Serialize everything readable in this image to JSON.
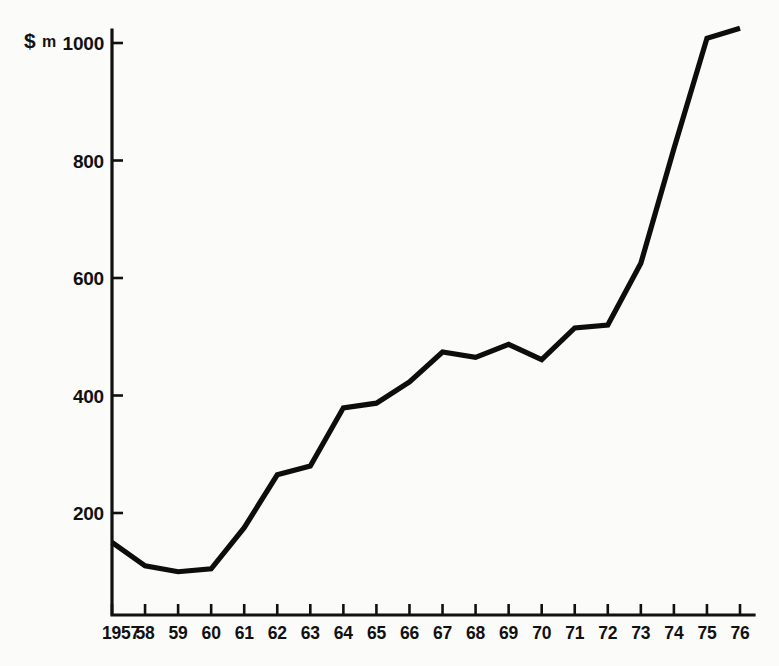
{
  "chart_data": {
    "type": "line",
    "title": "",
    "subtitle": "",
    "xlabel": "",
    "ylabel": "$ m",
    "unit_currency_symbol": "$",
    "unit_suffix": "m",
    "x": [
      1957,
      1958,
      1959,
      1960,
      1961,
      1962,
      1963,
      1964,
      1965,
      1966,
      1967,
      1968,
      1969,
      1970,
      1971,
      1972,
      1973,
      1974,
      1975,
      1976
    ],
    "xtick_labels": [
      "1957",
      "58",
      "59",
      "60",
      "61",
      "62",
      "63",
      "64",
      "65",
      "66",
      "67",
      "68",
      "69",
      "70",
      "71",
      "72",
      "73",
      "74",
      "75",
      "76"
    ],
    "values": [
      150,
      110,
      100,
      105,
      175,
      265,
      280,
      379,
      387,
      423,
      474,
      465,
      487,
      461,
      515,
      520,
      625,
      820,
      1008,
      1025
    ],
    "ytick_values": [
      200,
      400,
      600,
      800,
      1000
    ],
    "ytick_labels": [
      "200",
      "400",
      "600",
      "800",
      "1000"
    ],
    "ylim": [
      0,
      1070
    ],
    "xlim": [
      1957,
      1976
    ],
    "grid": false,
    "legend": false,
    "legend_position": "none",
    "series": [
      {
        "name": "",
        "values": [
          150,
          110,
          100,
          105,
          175,
          265,
          280,
          379,
          387,
          423,
          474,
          465,
          487,
          461,
          515,
          520,
          625,
          820,
          1008,
          1025
        ]
      }
    ],
    "colors": {
      "line": "#0d0d0d",
      "axis": "#111111",
      "background": "#fbfbfa",
      "text": "#111111"
    }
  }
}
